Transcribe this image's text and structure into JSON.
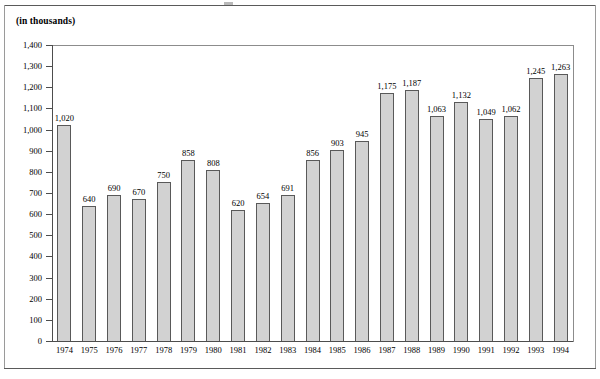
{
  "page": {
    "units_caption": "(in thousands)"
  },
  "chart_data": {
    "type": "bar",
    "title": "",
    "subtitle": "",
    "xlabel": "",
    "ylabel": "(in thousands)",
    "ylim": [
      0,
      1400
    ],
    "ytick_step": 100,
    "grid": false,
    "legend": null,
    "bar_color": "#d2d2d2",
    "bar_outline_color": "#595959",
    "axis_color": "#4d4d4d",
    "categories": [
      "1974",
      "1975",
      "1976",
      "1977",
      "1978",
      "1979",
      "1980",
      "1981",
      "1982",
      "1983",
      "1984",
      "1985",
      "1986",
      "1987",
      "1988",
      "1989",
      "1990",
      "1991",
      "1992",
      "1993",
      "1994"
    ],
    "values": [
      1020,
      640,
      690,
      670,
      750,
      858,
      808,
      620,
      654,
      691,
      856,
      903,
      945,
      1175,
      1187,
      1063,
      1132,
      1049,
      1062,
      1245,
      1263
    ],
    "value_labels": [
      "1,020",
      "640",
      "690",
      "670",
      "750",
      "858",
      "808",
      "620",
      "654",
      "691",
      "856",
      "903",
      "945",
      "1,175",
      "1,187",
      "1,063",
      "1,132",
      "1,049",
      "1,062",
      "1,245",
      "1,263"
    ],
    "ytick_labels": [
      "1,400",
      "1,300",
      "1,200",
      "1,100",
      "1,000",
      "900",
      "800",
      "700",
      "600",
      "500",
      "400",
      "300",
      "200",
      "100",
      "0"
    ],
    "ytick_values": [
      1400,
      1300,
      1200,
      1100,
      1000,
      900,
      800,
      700,
      600,
      500,
      400,
      300,
      200,
      100,
      0
    ]
  }
}
